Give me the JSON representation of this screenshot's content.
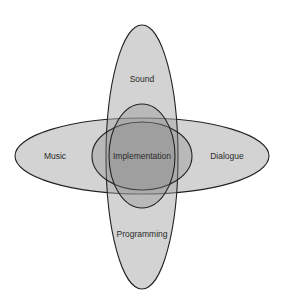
{
  "diagram": {
    "type": "venn",
    "background": "#ffffff",
    "stroke_color": "#222222",
    "fill_color": "#a8a8a8",
    "sets": [
      {
        "id": "sound",
        "label": "Sound",
        "shape": "ellipse",
        "cx": 142,
        "cy": 157,
        "rx": 36,
        "ry": 132,
        "label_x": 142,
        "label_y": 80
      },
      {
        "id": "music",
        "label": "Music",
        "shape": "ellipse",
        "cx": 142,
        "cy": 156,
        "rx": 127,
        "ry": 38,
        "label_x": 55,
        "label_y": 159
      },
      {
        "id": "dialogue",
        "label": "Dialogue",
        "shape": "ellipse",
        "cx": 142,
        "cy": 156,
        "rx": 127,
        "ry": 38,
        "label_x": 227,
        "label_y": 159
      },
      {
        "id": "programming",
        "label": "Programming",
        "shape": "ellipse",
        "cx": 142,
        "cy": 157,
        "rx": 36,
        "ry": 132,
        "label_x": 142,
        "label_y": 236
      },
      {
        "id": "inner-horizontal",
        "label": "",
        "shape": "ellipse",
        "cx": 142,
        "cy": 156,
        "rx": 50,
        "ry": 34
      },
      {
        "id": "inner-vertical",
        "label": "",
        "shape": "ellipse",
        "cx": 142,
        "cy": 156,
        "rx": 33,
        "ry": 52
      }
    ],
    "center_label": {
      "text": "Implementation",
      "x": 142,
      "y": 159
    },
    "labels": {
      "sound": "Sound",
      "music": "Music",
      "dialogue": "Dialogue",
      "programming": "Programming",
      "implementation": "Implementation"
    }
  }
}
